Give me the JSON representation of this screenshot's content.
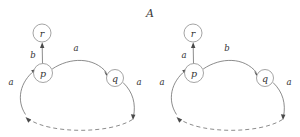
{
  "figure": {
    "title_text": "A",
    "title_style": "calligraphic-italic",
    "background_color": "#ffffff",
    "stroke_color": "#6f6f6f",
    "node_stroke_color": "#8d8d8d",
    "text_color": "#333333",
    "width": 300,
    "height": 137
  },
  "diagrams": [
    {
      "id": "left-automaton",
      "nodes": [
        {
          "id": "r",
          "label": "r",
          "cx": 42,
          "cy": 33,
          "r": 9
        },
        {
          "id": "p",
          "label": "p",
          "cx": 43,
          "cy": 73,
          "r": 9.5
        },
        {
          "id": "q",
          "label": "q",
          "cx": 115,
          "cy": 78,
          "r": 8.5
        }
      ],
      "edges": [
        {
          "id": "p-to-r",
          "from": "p",
          "to": "r",
          "label": "b",
          "label_x": 33,
          "label_y": 55,
          "style": "solid"
        },
        {
          "id": "p-to-q",
          "from": "p",
          "to": "q",
          "label": "a",
          "label_x": 76,
          "label_y": 48,
          "style": "solid"
        },
        {
          "id": "bottom-left-to-p",
          "from": "bottom-left",
          "to": "p",
          "label": "a",
          "label_x": 11,
          "label_y": 82,
          "style": "solid"
        },
        {
          "id": "q-to-bottom-right",
          "from": "q",
          "to": "bottom-right",
          "label": "a",
          "label_x": 139,
          "label_y": 82,
          "style": "solid"
        },
        {
          "id": "dashed-return",
          "from": "bottom-right",
          "to": "bottom-left",
          "label": "",
          "style": "dashed"
        }
      ]
    },
    {
      "id": "right-automaton",
      "nodes": [
        {
          "id": "r",
          "label": "r",
          "cx": 193,
          "cy": 33,
          "r": 9
        },
        {
          "id": "p",
          "label": "p",
          "cx": 194,
          "cy": 73,
          "r": 9.5
        },
        {
          "id": "q",
          "label": "q",
          "cx": 265,
          "cy": 78,
          "r": 8.5
        }
      ],
      "edges": [
        {
          "id": "p-to-r",
          "from": "p",
          "to": "r",
          "label": "a",
          "label_x": 184,
          "label_y": 55,
          "style": "solid"
        },
        {
          "id": "p-to-q",
          "from": "p",
          "to": "q",
          "label": "b",
          "label_x": 227,
          "label_y": 48,
          "style": "solid"
        },
        {
          "id": "bottom-left-to-p",
          "from": "bottom-left",
          "to": "p",
          "label": "a",
          "label_x": 162,
          "label_y": 82,
          "style": "solid"
        },
        {
          "id": "q-to-bottom-right",
          "from": "q",
          "to": "bottom-right",
          "label": "a",
          "label_x": 289,
          "label_y": 82,
          "style": "solid"
        },
        {
          "id": "dashed-return",
          "from": "bottom-right",
          "to": "bottom-left",
          "label": "",
          "style": "dashed"
        }
      ]
    }
  ]
}
